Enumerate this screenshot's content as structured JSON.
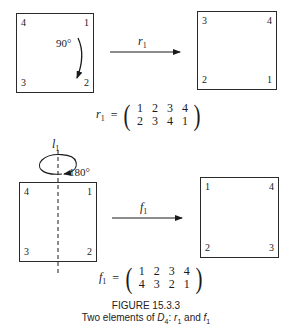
{
  "figure": {
    "number": "FIGURE 15.3.3",
    "caption_prefix": "Two elements of ",
    "caption_group": "D",
    "caption_group_sub": "4",
    "caption_sep": ": ",
    "caption_elem1": "r",
    "caption_elem1_sub": "1",
    "caption_and": " and ",
    "caption_elem2": "f",
    "caption_elem2_sub": "1"
  },
  "rotation": {
    "before": {
      "tl": "4",
      "tr": "1",
      "bl": "3",
      "br": "2"
    },
    "angle_label": "90°",
    "arrow_label": "r",
    "arrow_label_sub": "1",
    "after": {
      "tl": "3",
      "tr": "4",
      "bl": "2",
      "br": "1"
    },
    "equation": {
      "name": "r",
      "name_sub": "1",
      "equals": "=",
      "top_row": [
        "1",
        "2",
        "3",
        "4"
      ],
      "bottom_row": [
        "2",
        "3",
        "4",
        "1"
      ]
    }
  },
  "reflection": {
    "axis_label": "l",
    "axis_label_sub": "1",
    "angle_label": "180°",
    "before": {
      "tl": "4",
      "tr": "1",
      "bl": "3",
      "br": "2"
    },
    "arrow_label": "f",
    "arrow_label_sub": "1",
    "after": {
      "tl": "1",
      "tr": "4",
      "bl": "2",
      "br": "3"
    },
    "equation": {
      "name": "f",
      "name_sub": "1",
      "equals": "=",
      "top_row": [
        "1",
        "2",
        "3",
        "4"
      ],
      "bottom_row": [
        "4",
        "3",
        "2",
        "1"
      ]
    }
  },
  "colors": {
    "ink": "#1a1a1a",
    "background": "#ffffff"
  }
}
